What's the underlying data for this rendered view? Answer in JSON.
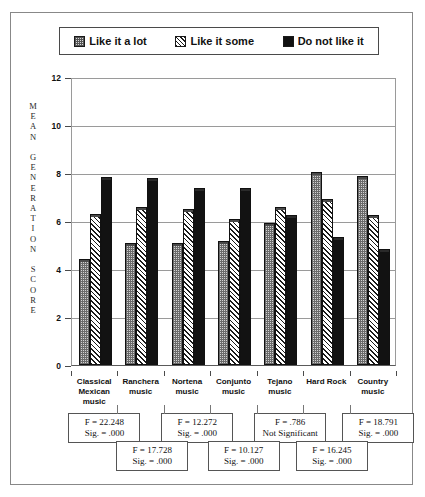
{
  "chart_data": {
    "type": "bar",
    "title": "",
    "xlabel": "",
    "ylabel": "MEAN GENERATION SCORE",
    "ylim": [
      0,
      12
    ],
    "yticks": [
      0,
      2,
      4,
      6,
      8,
      10,
      12
    ],
    "grid": true,
    "legend_position": "top",
    "categories": [
      "Classical Mexican music",
      "Ranchera music",
      "Nortena music",
      "Conjunto music",
      "Tejano music",
      "Hard Rock",
      "Country music"
    ],
    "series": [
      {
        "name": "Like it a lot",
        "values": [
          4.35,
          5.0,
          5.0,
          5.1,
          5.85,
          7.95,
          7.8
        ]
      },
      {
        "name": "Like it some",
        "values": [
          6.2,
          6.5,
          6.4,
          6.0,
          6.5,
          6.85,
          6.15
        ]
      },
      {
        "name": "Do not like it",
        "values": [
          7.75,
          7.7,
          7.3,
          7.3,
          6.15,
          5.25,
          4.75
        ]
      }
    ],
    "annotations": [
      {
        "f": "F = 22.248",
        "sig": "Sig. = .000"
      },
      {
        "f": "F = 17.728",
        "sig": "Sig. = .000"
      },
      {
        "f": "F = 12.272",
        "sig": "Sig. = .000"
      },
      {
        "f": "F = 10.127",
        "sig": "Sig. = .000"
      },
      {
        "f": "F = .786",
        "sig": "Not Significant"
      },
      {
        "f": "F = 16.245",
        "sig": "Sig. = .000"
      },
      {
        "f": "F = 18.791",
        "sig": "Sig. = .000"
      }
    ]
  },
  "legend": {
    "items": [
      {
        "label": "Like it a lot",
        "swatch": "dotted-square-icon"
      },
      {
        "label": "Like it some",
        "swatch": "hatched-square-icon"
      },
      {
        "label": "Do not like it",
        "swatch": "solid-square-icon"
      }
    ]
  },
  "axis": {
    "y_title_chars": "M\nE\nA\nN\n\nG\nE\nN\nE\nR\nA\nT\nI\nO\nN\n\nS\nC\nO\nR\nE",
    "ytick_labels": [
      "12",
      "10",
      "8",
      "6",
      "4",
      "2",
      "0"
    ]
  },
  "xaxis": {
    "labels": [
      [
        "Classical",
        "Mexican",
        "music"
      ],
      [
        "Ranchera",
        "music"
      ],
      [
        "Nortena",
        "music"
      ],
      [
        "Conjunto",
        "music"
      ],
      [
        "Tejano",
        "music"
      ],
      [
        "Hard Rock"
      ],
      [
        "Country",
        "music"
      ]
    ]
  },
  "colors": {
    "series_like_a_lot": "#d2d2d2",
    "series_like_some": "#ffffff",
    "series_do_not_like": "#121212",
    "frame": "#888888",
    "grid": "#9a9a9a"
  }
}
